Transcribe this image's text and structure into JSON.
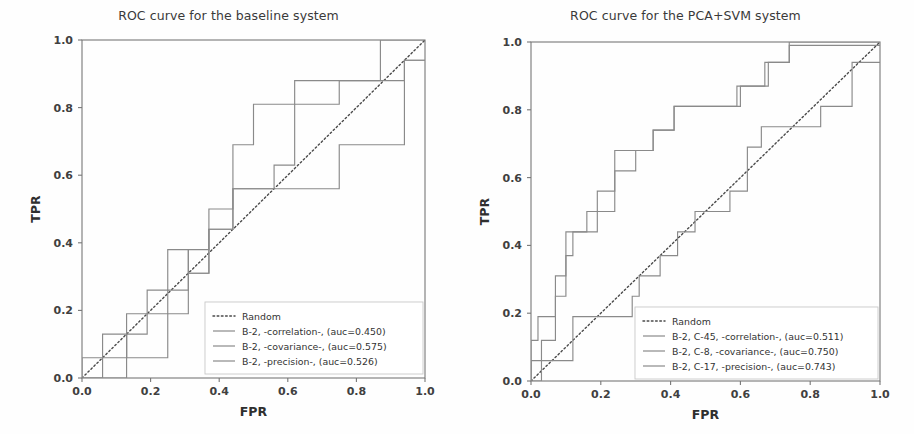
{
  "figure": {
    "width": 914,
    "height": 434,
    "background": "#fefefe",
    "curve_color": "#8a8a8a",
    "random_color": "#4a4a4a"
  },
  "chart_data": [
    {
      "id": "baseline",
      "type": "line",
      "title": "ROC curve for the baseline system",
      "xlabel": "FPR",
      "ylabel": "TPR",
      "xlim": [
        0,
        1
      ],
      "ylim": [
        0,
        1
      ],
      "xticks": [
        "0.0",
        "0.2",
        "0.4",
        "0.6",
        "0.8",
        "1.0"
      ],
      "yticks": [
        "0.0",
        "0.2",
        "0.4",
        "0.6",
        "0.8",
        "1.0"
      ],
      "xtick_values": [
        0.0,
        0.2,
        0.4,
        0.6,
        0.8,
        1.0
      ],
      "ytick_values": [
        0.0,
        0.2,
        0.4,
        0.6,
        0.8,
        1.0
      ],
      "grid": false,
      "legend_position": "lower right",
      "series": [
        {
          "name": "Random",
          "style": "dotted",
          "x": [
            0.0,
            1.0
          ],
          "y": [
            0.0,
            1.0
          ]
        },
        {
          "name": "B-2, -correlation-, (auc=0.450)",
          "auc": 0.45,
          "style": "solid",
          "x": [
            0.0,
            0.0,
            0.06,
            0.06,
            0.13,
            0.13,
            0.25,
            0.25,
            0.31,
            0.31,
            0.37,
            0.37,
            0.44,
            0.44,
            0.75,
            0.75,
            0.94,
            0.94,
            1.0
          ],
          "y": [
            0.0,
            0.0,
            0.0,
            0.13,
            0.13,
            0.06,
            0.06,
            0.19,
            0.19,
            0.31,
            0.31,
            0.44,
            0.44,
            0.56,
            0.56,
            0.69,
            0.69,
            0.94,
            0.94
          ]
        },
        {
          "name": "B-2, -covariance-, (auc=0.575)",
          "auc": 0.575,
          "style": "solid",
          "x": [
            0.0,
            0.13,
            0.13,
            0.19,
            0.19,
            0.25,
            0.25,
            0.31,
            0.31,
            0.37,
            0.37,
            0.44,
            0.44,
            0.5,
            0.5,
            0.62,
            0.62,
            0.94,
            0.94,
            1.0
          ],
          "y": [
            0.0,
            0.0,
            0.13,
            0.13,
            0.19,
            0.19,
            0.26,
            0.26,
            0.38,
            0.38,
            0.5,
            0.5,
            0.69,
            0.69,
            0.81,
            0.81,
            0.88,
            0.88,
            0.94,
            0.94
          ]
        },
        {
          "name": "B-2, -precision-, (auc=0.526)",
          "auc": 0.526,
          "style": "solid",
          "x": [
            0.0,
            0.0,
            0.13,
            0.13,
            0.19,
            0.19,
            0.25,
            0.25,
            0.31,
            0.31,
            0.37,
            0.37,
            0.44,
            0.44,
            0.56,
            0.56,
            0.62,
            0.62,
            0.75,
            0.75,
            0.87,
            0.87,
            1.0,
            1.0
          ],
          "y": [
            0.0,
            0.06,
            0.06,
            0.19,
            0.19,
            0.26,
            0.26,
            0.38,
            0.38,
            0.31,
            0.31,
            0.44,
            0.44,
            0.56,
            0.56,
            0.63,
            0.63,
            0.81,
            0.81,
            0.88,
            0.88,
            1.0,
            1.0,
            1.0
          ]
        }
      ]
    },
    {
      "id": "pca-svm",
      "type": "line",
      "title": "ROC curve for the PCA+SVM system",
      "xlabel": "FPR",
      "ylabel": "TPR",
      "xlim": [
        0,
        1
      ],
      "ylim": [
        0,
        1
      ],
      "xticks": [
        "0.0",
        "0.2",
        "0.4",
        "0.6",
        "0.8",
        "1.0"
      ],
      "yticks": [
        "0.0",
        "0.2",
        "0.4",
        "0.6",
        "0.8",
        "1.0"
      ],
      "xtick_values": [
        0.0,
        0.2,
        0.4,
        0.6,
        0.8,
        1.0
      ],
      "ytick_values": [
        0.0,
        0.2,
        0.4,
        0.6,
        0.8,
        1.0
      ],
      "grid": false,
      "legend_position": "lower right",
      "series": [
        {
          "name": "Random",
          "style": "dotted",
          "x": [
            0.0,
            1.0
          ],
          "y": [
            0.0,
            1.0
          ]
        },
        {
          "name": "B-2, C-45, -correlation-, (auc=0.511)",
          "auc": 0.511,
          "style": "solid",
          "x": [
            0.0,
            0.0,
            0.03,
            0.03,
            0.12,
            0.12,
            0.29,
            0.29,
            0.31,
            0.31,
            0.37,
            0.37,
            0.42,
            0.42,
            0.47,
            0.47,
            0.57,
            0.57,
            0.62,
            0.62,
            0.66,
            0.66,
            0.71,
            0.71,
            0.83,
            0.83,
            0.92,
            0.92,
            1.0
          ],
          "y": [
            0.0,
            0.06,
            0.06,
            0.06,
            0.06,
            0.19,
            0.19,
            0.25,
            0.25,
            0.31,
            0.31,
            0.37,
            0.37,
            0.44,
            0.44,
            0.5,
            0.5,
            0.56,
            0.56,
            0.69,
            0.69,
            0.75,
            0.75,
            0.75,
            0.75,
            0.81,
            0.81,
            0.94,
            0.94
          ]
        },
        {
          "name": "B-2, C-8, -covariance-, (auc=0.750)",
          "auc": 0.75,
          "style": "solid",
          "x": [
            0.0,
            0.0,
            0.02,
            0.02,
            0.07,
            0.07,
            0.1,
            0.1,
            0.16,
            0.16,
            0.24,
            0.24,
            0.3,
            0.3,
            0.35,
            0.35,
            0.41,
            0.41,
            0.59,
            0.59,
            0.67,
            0.67,
            0.74,
            0.74,
            1.0
          ],
          "y": [
            0.0,
            0.12,
            0.12,
            0.19,
            0.19,
            0.31,
            0.31,
            0.44,
            0.44,
            0.5,
            0.5,
            0.62,
            0.62,
            0.68,
            0.68,
            0.74,
            0.74,
            0.81,
            0.81,
            0.87,
            0.87,
            0.94,
            0.94,
            1.0,
            1.0
          ]
        },
        {
          "name": "B-2, C-17, -precision-, (auc=0.743)",
          "auc": 0.743,
          "style": "solid",
          "x": [
            0.0,
            0.0,
            0.03,
            0.03,
            0.07,
            0.07,
            0.1,
            0.1,
            0.12,
            0.12,
            0.19,
            0.19,
            0.24,
            0.24,
            0.35,
            0.35,
            0.41,
            0.41,
            0.6,
            0.6,
            0.68,
            0.68,
            0.74,
            0.74,
            0.92,
            0.92,
            1.0
          ],
          "y": [
            0.0,
            0.0,
            0.0,
            0.12,
            0.12,
            0.25,
            0.25,
            0.37,
            0.37,
            0.44,
            0.44,
            0.56,
            0.56,
            0.68,
            0.68,
            0.74,
            0.74,
            0.81,
            0.81,
            0.87,
            0.87,
            0.94,
            0.94,
            0.99,
            0.99,
            0.99,
            0.99
          ]
        }
      ]
    }
  ]
}
